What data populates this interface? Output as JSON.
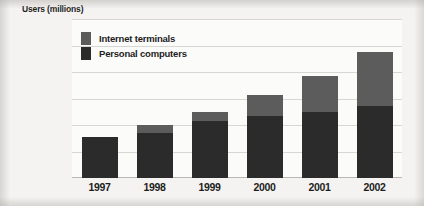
{
  "chart_data": {
    "type": "bar",
    "subtype": "stacked-bar",
    "title": "",
    "xlabel": "",
    "ylabel": "Users (millions)",
    "categories": [
      "1997",
      "1998",
      "1999",
      "2000",
      "2001",
      "2002"
    ],
    "series": [
      {
        "name": "Personal computers",
        "values": [
          31,
          34,
          43,
          47,
          50,
          54
        ],
        "color": "#2b2b2b"
      },
      {
        "name": "Internet terminals",
        "values": [
          0,
          6,
          7,
          16,
          27,
          41
        ],
        "color": "#5c5c5c"
      }
    ],
    "totals": [
      31,
      40,
      50,
      63,
      77,
      95
    ],
    "ylim": [
      0,
      120
    ],
    "yticks": [
      0,
      20,
      40,
      60,
      80,
      100,
      120
    ],
    "ytick_labels": [
      "0",
      "20",
      "40",
      "60",
      "80",
      "100",
      "120"
    ],
    "grid": true,
    "legend_position": "top-left",
    "legend_entries": [
      "Internet terminals",
      "Personal computers"
    ],
    "stack_order_bottom_to_top": [
      "Personal computers",
      "Internet terminals"
    ]
  },
  "axis": {
    "y_title": "Users (millions)"
  },
  "legend": {
    "items": [
      {
        "label": "Internet terminals",
        "swatch": "legend-swatch-internet-terminals"
      },
      {
        "label": "Personal computers",
        "swatch": "legend-swatch-personal-computers"
      }
    ]
  },
  "colors": {
    "personal_computers": "#2b2b2b",
    "internet_terminals": "#5c5c5c",
    "gridline": "#d8d6d2",
    "plot_background": "#fbfbfa",
    "page_background": "#f4f3f1",
    "text": "#1d1d1d"
  }
}
